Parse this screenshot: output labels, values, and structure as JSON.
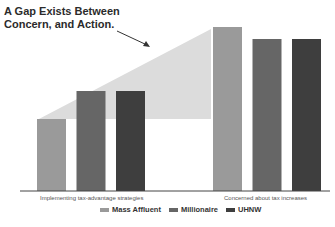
{
  "chart_data": {
    "type": "bar",
    "title": "A Gap Exists Between Concern, and Action.",
    "title_lines": [
      "A Gap Exists Between",
      "Concern, and Action."
    ],
    "categories": [
      "Implementing tax-advantage strategies",
      "Concerned about tax increases"
    ],
    "series": [
      {
        "name": "Mass Affluent",
        "color": "#9a9a9a",
        "values": [
          36,
          82
        ]
      },
      {
        "name": "Millionaire",
        "color": "#666666",
        "values": [
          50,
          76
        ]
      },
      {
        "name": "UHNW",
        "color": "#3e3e3e",
        "values": [
          50,
          76
        ]
      }
    ],
    "annotation": "Gap shaded region between action and concern",
    "gap_color": "#dcdcdc",
    "xlabel": "",
    "ylabel": "",
    "ylim": [
      0,
      100
    ],
    "grid": false,
    "legend_position": "bottom"
  },
  "legend": [
    {
      "label": "Mass Affluent",
      "color": "#9a9a9a"
    },
    {
      "label": "Millionaire",
      "color": "#666666"
    },
    {
      "label": "UHNW",
      "color": "#3e3e3e"
    }
  ]
}
